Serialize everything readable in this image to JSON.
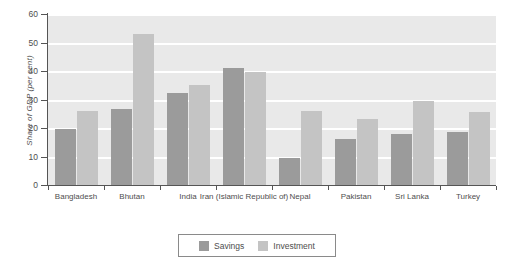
{
  "chart_data": {
    "type": "bar",
    "title": "",
    "subtitle": "",
    "xlabel": "",
    "ylabel": "Share of GDP (per cent)",
    "ylim": [
      0,
      60
    ],
    "ytick_labels": [
      "0",
      "10",
      "20",
      "30",
      "40",
      "50",
      "60"
    ],
    "ytick_values": [
      0,
      10,
      20,
      30,
      40,
      50,
      60
    ],
    "grid": true,
    "grid_axis": "y",
    "grid_color": "#ffffff",
    "plot_background": "#e9e9e9",
    "legend_position": "bottom-center",
    "categories": [
      "Bangladesh",
      "Bhutan",
      "India",
      "Iran (Islamic Republic of)",
      "Nepal",
      "Pakistan",
      "Sri Lanka",
      "Turkey"
    ],
    "series": [
      {
        "name": "Savings",
        "color": "#9b9b9b",
        "values": [
          19.5,
          26.5,
          32.2,
          41.0,
          9.5,
          16.2,
          18.0,
          18.5
        ]
      },
      {
        "name": "Investment",
        "color": "#c4c4c4",
        "values": [
          26.0,
          53.0,
          35.0,
          39.5,
          26.0,
          23.2,
          29.5,
          25.5
        ]
      }
    ]
  }
}
